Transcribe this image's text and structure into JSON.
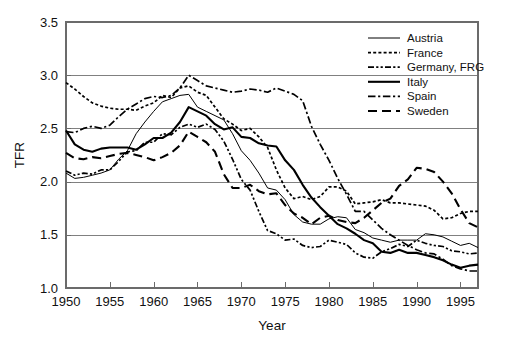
{
  "chart_data": {
    "type": "line",
    "title": "",
    "xlabel": "Year",
    "ylabel": "TFR",
    "xlim": [
      1950,
      1997
    ],
    "ylim": [
      1.0,
      3.5
    ],
    "xticks": [
      1950,
      1955,
      1960,
      1965,
      1970,
      1975,
      1980,
      1985,
      1990,
      1995
    ],
    "yticks": [
      1.0,
      1.5,
      2.0,
      2.5,
      3.0,
      3.5
    ],
    "ytick_labels": [
      "1.0",
      "1.5",
      "2.0",
      "2.5",
      "3.0",
      "3.5"
    ],
    "xtick_labels": [
      "1950",
      "1955",
      "1960",
      "1965",
      "1970",
      "1975",
      "1980",
      "1985",
      "1990",
      "1995"
    ],
    "grid": "horizontal",
    "legend_position": "top-right",
    "x": [
      1950,
      1951,
      1952,
      1953,
      1954,
      1955,
      1956,
      1957,
      1958,
      1959,
      1960,
      1961,
      1962,
      1963,
      1964,
      1965,
      1966,
      1967,
      1968,
      1969,
      1970,
      1971,
      1972,
      1973,
      1974,
      1975,
      1976,
      1977,
      1978,
      1979,
      1980,
      1981,
      1982,
      1983,
      1984,
      1985,
      1986,
      1987,
      1988,
      1989,
      1990,
      1991,
      1992,
      1993,
      1994,
      1995,
      1996,
      1997
    ],
    "series": [
      {
        "name": "Austria",
        "line_style": "solid-thin",
        "values": [
          2.08,
          2.03,
          2.04,
          2.06,
          2.08,
          2.11,
          2.21,
          2.29,
          2.45,
          2.56,
          2.66,
          2.75,
          2.78,
          2.81,
          2.82,
          2.7,
          2.66,
          2.62,
          2.58,
          2.45,
          2.29,
          2.2,
          2.08,
          1.94,
          1.92,
          1.83,
          1.69,
          1.62,
          1.6,
          1.6,
          1.65,
          1.67,
          1.66,
          1.55,
          1.52,
          1.47,
          1.45,
          1.43,
          1.45,
          1.45,
          1.45,
          1.51,
          1.5,
          1.48,
          1.44,
          1.4,
          1.42,
          1.38
        ]
      },
      {
        "name": "France",
        "line_style": "dotted-dense",
        "values": [
          2.93,
          2.87,
          2.8,
          2.74,
          2.71,
          2.69,
          2.68,
          2.68,
          2.67,
          2.71,
          2.74,
          2.81,
          2.79,
          2.88,
          2.9,
          2.84,
          2.81,
          2.7,
          2.59,
          2.54,
          2.48,
          2.5,
          2.42,
          2.32,
          2.11,
          1.94,
          1.84,
          1.86,
          1.83,
          1.86,
          1.95,
          1.95,
          1.91,
          1.79,
          1.8,
          1.81,
          1.83,
          1.8,
          1.8,
          1.79,
          1.78,
          1.77,
          1.73,
          1.65,
          1.66,
          1.7,
          1.72,
          1.72
        ]
      },
      {
        "name": "Germany, FRG",
        "line_style": "dash-dot-dot",
        "values": [
          2.1,
          2.06,
          2.08,
          2.07,
          2.11,
          2.11,
          2.19,
          2.28,
          2.29,
          2.37,
          2.37,
          2.45,
          2.44,
          2.51,
          2.54,
          2.51,
          2.54,
          2.49,
          2.38,
          2.21,
          2.02,
          1.92,
          1.72,
          1.54,
          1.51,
          1.45,
          1.46,
          1.4,
          1.38,
          1.39,
          1.45,
          1.43,
          1.41,
          1.33,
          1.29,
          1.28,
          1.34,
          1.37,
          1.41,
          1.39,
          1.45,
          1.42,
          1.4,
          1.39,
          1.35,
          1.34,
          1.32,
          1.33
        ]
      },
      {
        "name": "Italy",
        "line_style": "solid-thick",
        "values": [
          2.48,
          2.35,
          2.3,
          2.28,
          2.31,
          2.32,
          2.32,
          2.32,
          2.3,
          2.35,
          2.41,
          2.41,
          2.46,
          2.56,
          2.7,
          2.66,
          2.62,
          2.54,
          2.49,
          2.51,
          2.42,
          2.41,
          2.36,
          2.34,
          2.33,
          2.2,
          2.11,
          1.97,
          1.85,
          1.76,
          1.68,
          1.6,
          1.56,
          1.51,
          1.45,
          1.42,
          1.34,
          1.33,
          1.36,
          1.33,
          1.33,
          1.31,
          1.29,
          1.26,
          1.22,
          1.19,
          1.21,
          1.22
        ]
      },
      {
        "name": "Spain",
        "line_style": "dash-dot",
        "values": [
          2.47,
          2.46,
          2.5,
          2.52,
          2.5,
          2.53,
          2.61,
          2.68,
          2.73,
          2.78,
          2.8,
          2.79,
          2.81,
          2.88,
          3.0,
          2.95,
          2.9,
          2.88,
          2.86,
          2.84,
          2.85,
          2.87,
          2.86,
          2.84,
          2.88,
          2.85,
          2.82,
          2.76,
          2.52,
          2.35,
          2.2,
          2.03,
          1.88,
          1.72,
          1.72,
          1.64,
          1.56,
          1.5,
          1.45,
          1.4,
          1.36,
          1.33,
          1.32,
          1.27,
          1.21,
          1.18,
          1.16,
          1.16
        ]
      },
      {
        "name": "Sweden",
        "line_style": "dashed-long",
        "values": [
          2.27,
          2.22,
          2.21,
          2.23,
          2.22,
          2.24,
          2.26,
          2.27,
          2.25,
          2.23,
          2.2,
          2.23,
          2.27,
          2.34,
          2.47,
          2.42,
          2.37,
          2.28,
          2.07,
          1.94,
          1.94,
          1.97,
          1.91,
          1.88,
          1.89,
          1.78,
          1.7,
          1.66,
          1.6,
          1.66,
          1.68,
          1.64,
          1.62,
          1.61,
          1.66,
          1.73,
          1.8,
          1.84,
          1.96,
          2.02,
          2.13,
          2.12,
          2.09,
          2.0,
          1.89,
          1.74,
          1.61,
          1.57
        ]
      }
    ],
    "legend": [
      {
        "label": "Austria",
        "style": "solid-thin"
      },
      {
        "label": "France",
        "style": "dotted-dense"
      },
      {
        "label": "Germany, FRG",
        "style": "dash-dot-dot"
      },
      {
        "label": "Italy",
        "style": "solid-thick"
      },
      {
        "label": "Spain",
        "style": "dash-dot"
      },
      {
        "label": "Sweden",
        "style": "dashed-long"
      }
    ],
    "colors": {
      "series": "#000000",
      "grid": "#808080",
      "frame": "#6b6b6b",
      "text": "#111111",
      "background": "#ffffff"
    }
  }
}
